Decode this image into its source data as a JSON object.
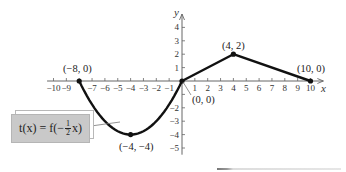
{
  "chart_data": {
    "type": "line",
    "title": "",
    "xlabel": "x",
    "ylabel": "y",
    "xlim": [
      -10.5,
      11
    ],
    "ylim": [
      -5.5,
      5
    ],
    "x_ticks": [
      -10,
      -9,
      -8,
      -7,
      -6,
      -5,
      -4,
      -3,
      -2,
      -1,
      1,
      2,
      3,
      4,
      5,
      6,
      7,
      8,
      9,
      10
    ],
    "x_tick_labels": [
      "−10",
      "−9",
      "",
      "−7",
      "−6",
      "−5",
      "−4",
      "−3",
      "−2",
      "−1",
      "1",
      "2",
      "3",
      "4",
      "5",
      "6",
      "7",
      "8",
      "9",
      "10"
    ],
    "y_ticks": [
      -5,
      -4,
      -3,
      -2,
      -1,
      1,
      2,
      3,
      4
    ],
    "y_tick_labels": [
      "−5",
      "−4",
      "−3",
      "−2",
      "",
      "1",
      "2",
      "3",
      "4"
    ],
    "grid": false,
    "series": [
      {
        "name": "t(x) = f(−½x)",
        "segments": [
          {
            "shape": "parabola",
            "points": [
              [
                -8,
                0
              ],
              [
                -4,
                -4
              ],
              [
                0,
                0
              ]
            ]
          },
          {
            "shape": "line",
            "points": [
              [
                0,
                0
              ],
              [
                4,
                2
              ]
            ]
          },
          {
            "shape": "line",
            "points": [
              [
                4,
                2
              ],
              [
                10,
                0
              ]
            ]
          }
        ],
        "marked_points": [
          [
            -8,
            0
          ],
          [
            -4,
            -4
          ],
          [
            0,
            0
          ],
          [
            4,
            2
          ],
          [
            10,
            0
          ]
        ],
        "color": "#111111"
      }
    ],
    "annotations": [
      {
        "text": "(−8, 0)",
        "at": [
          -8,
          0
        ]
      },
      {
        "text": "(−4, −4)",
        "at": [
          -4,
          -4
        ]
      },
      {
        "text": "(0, 0)",
        "at": [
          0,
          0
        ]
      },
      {
        "text": "(4, 2)",
        "at": [
          4,
          2
        ]
      },
      {
        "text": "(10, 0)",
        "at": [
          10,
          0
        ]
      }
    ],
    "legend": {
      "text": "t(x) = f(−½x)",
      "position": "lower-left"
    }
  },
  "label": {
    "prefix": "t(x) = f(−",
    "frac_num": "1",
    "frac_den": "2",
    "suffix": "x)"
  },
  "axes": {
    "x_name": "x",
    "y_name": "y"
  },
  "points": {
    "p1": "(−8, 0)",
    "p2": "(−4, −4)",
    "p3": "(0, 0)",
    "p4": "(4, 2)",
    "p5": "(10, 0)"
  }
}
